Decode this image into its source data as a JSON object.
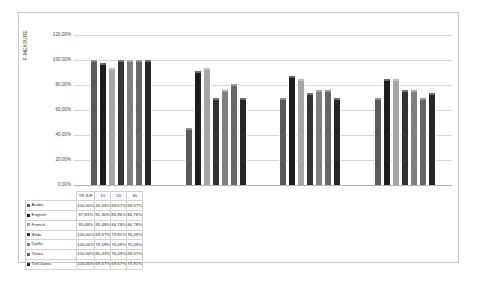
{
  "chart_data": {
    "type": "bar",
    "title": "",
    "xlabel": "",
    "ylabel": "F-MEASURE",
    "ylim": [
      0,
      120
    ],
    "ytick_labels": [
      "120,00%",
      "100,00%",
      "80,00%",
      "60,00%",
      "40,00%",
      "20,00%",
      "0,00%"
    ],
    "ytick_values": [
      120,
      100,
      80,
      60,
      40,
      20,
      0
    ],
    "grid": true,
    "legend_position": "table-row-headers",
    "categories": [
      "TF-IDF",
      "10",
      "20",
      "30"
    ],
    "series": [
      {
        "name": "Arabic",
        "color": "#595959",
        "values": [
          100.0,
          45.65,
          69.57,
          69.57
        ],
        "labels": [
          "100,00%",
          "45,65%",
          "69,57%",
          "69,57%"
        ]
      },
      {
        "name": "English",
        "color": "#1c1c1c",
        "values": [
          97.83,
          91.3,
          86.96,
          84.78
        ],
        "labels": [
          "97,83%",
          "91,30%",
          "86,96%",
          "84,78%"
        ]
      },
      {
        "name": "French",
        "color": "#a6a6a6",
        "values": [
          93.48,
          93.48,
          84.78,
          84.78
        ],
        "labels": [
          "93,48%",
          "93,48%",
          "84,78%",
          "84,78%"
        ]
      },
      {
        "name": "Blida",
        "color": "#333333",
        "values": [
          100.0,
          69.57,
          73.91,
          76.09
        ],
        "labels": [
          "100,00%",
          "69,57%",
          "73,91%",
          "76,09%"
        ]
      },
      {
        "name": "Djelfa",
        "color": "#7f7f7f",
        "values": [
          100.0,
          76.09,
          76.09,
          76.09
        ],
        "labels": [
          "100,00%",
          "76,09%",
          "76,09%",
          "76,09%"
        ]
      },
      {
        "name": "Tenes",
        "color": "#666666",
        "values": [
          100.0,
          80.43,
          76.09,
          69.57
        ],
        "labels": [
          "100,00%",
          "80,43%",
          "76,09%",
          "69,57%"
        ]
      },
      {
        "name": "TiziOuzou",
        "color": "#262626",
        "values": [
          100.0,
          69.57,
          69.57,
          73.91
        ],
        "labels": [
          "100,00%",
          "69,57%",
          "69,57%",
          "73,91%"
        ]
      }
    ]
  },
  "table": {
    "corner_label": "",
    "column_headers": [
      "TF-IDF",
      "10",
      "20",
      "30"
    ],
    "rows": [
      {
        "label": "Arabic",
        "swatch": "#595959",
        "values": [
          "100,00%",
          "45,65%",
          "69,57%",
          "69,57%"
        ]
      },
      {
        "label": "English",
        "swatch": "#1c1c1c",
        "values": [
          "97,83%",
          "91,30%",
          "86,96%",
          "84,78%"
        ]
      },
      {
        "label": "French",
        "swatch": "#a6a6a6",
        "values": [
          "93,48%",
          "93,48%",
          "84,78%",
          "84,78%"
        ]
      },
      {
        "label": "Blida",
        "swatch": "#333333",
        "values": [
          "100,00%",
          "69,57%",
          "73,91%",
          "76,09%"
        ]
      },
      {
        "label": "Djelfa",
        "swatch": "#7f7f7f",
        "values": [
          "100,00%",
          "76,09%",
          "76,09%",
          "76,09%"
        ]
      },
      {
        "label": "Tenes",
        "swatch": "#666666",
        "values": [
          "100,00%",
          "80,43%",
          "76,09%",
          "69,57%"
        ]
      },
      {
        "label": "TiziOuzou",
        "swatch": "#262626",
        "values": [
          "100,00%",
          "69,57%",
          "69,57%",
          "73,91%"
        ]
      }
    ]
  }
}
